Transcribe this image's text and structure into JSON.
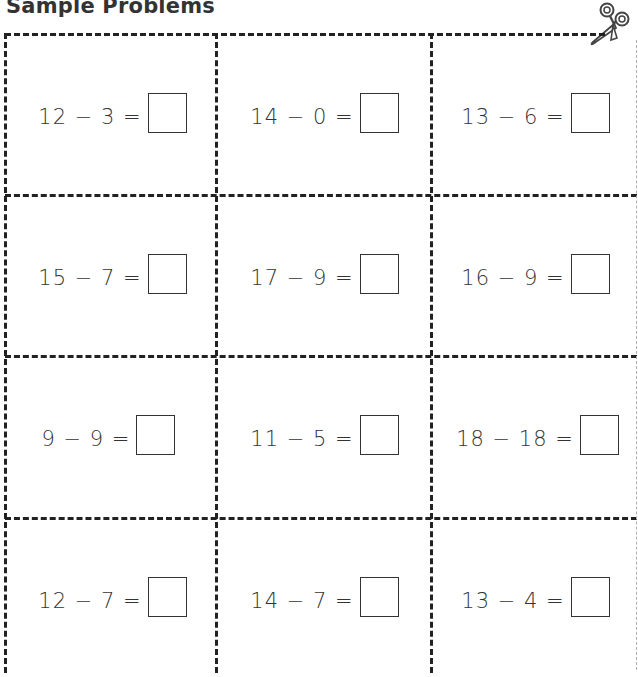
{
  "header": {
    "title": "Sample Problems",
    "cut_icon": "scissors-icon"
  },
  "problems": [
    [
      {
        "minuend": "12",
        "subtrahend": "3",
        "operator": "−",
        "equals": "=",
        "answer": ""
      },
      {
        "minuend": "14",
        "subtrahend": "0",
        "operator": "−",
        "equals": "=",
        "answer": ""
      },
      {
        "minuend": "13",
        "subtrahend": "6",
        "operator": "−",
        "equals": "=",
        "answer": ""
      }
    ],
    [
      {
        "minuend": "15",
        "subtrahend": "7",
        "operator": "−",
        "equals": "=",
        "answer": ""
      },
      {
        "minuend": "17",
        "subtrahend": "9",
        "operator": "−",
        "equals": "=",
        "answer": ""
      },
      {
        "minuend": "16",
        "subtrahend": "9",
        "operator": "−",
        "equals": "=",
        "answer": ""
      }
    ],
    [
      {
        "minuend": "9",
        "subtrahend": "9",
        "operator": "−",
        "equals": "=",
        "answer": ""
      },
      {
        "minuend": "11",
        "subtrahend": "5",
        "operator": "−",
        "equals": "=",
        "answer": ""
      },
      {
        "minuend": "18",
        "subtrahend": "18",
        "operator": "−",
        "equals": "=",
        "answer": ""
      }
    ],
    [
      {
        "minuend": "12",
        "subtrahend": "7",
        "operator": "−",
        "equals": "=",
        "answer": ""
      },
      {
        "minuend": "14",
        "subtrahend": "7",
        "operator": "−",
        "equals": "=",
        "answer": ""
      },
      {
        "minuend": "13",
        "subtrahend": "4",
        "operator": "−",
        "equals": "=",
        "answer": ""
      }
    ]
  ],
  "expressions": [
    [
      "12 − 3 =",
      "14 − 0 =",
      "13 − 6 ="
    ],
    [
      "15 − 7 =",
      "17 − 9 =",
      "16 − 9 ="
    ],
    [
      "9 − 9 =",
      "11 − 5 =",
      "18 − 18 ="
    ],
    [
      "12 − 7 =",
      "14 − 7 =",
      "13 − 4 ="
    ]
  ],
  "colors": {
    "ink": "#333333",
    "dash": "#222222",
    "faint_edge": "#b0b0b0",
    "paper": "#ffffff"
  }
}
